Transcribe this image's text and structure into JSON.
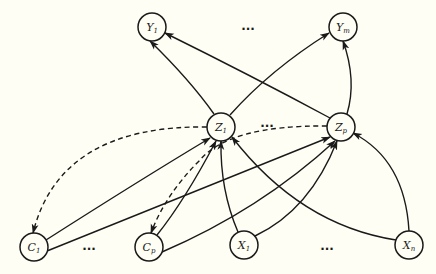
{
  "diagram": {
    "type": "directed-graph",
    "background": "#fffef4",
    "stroke_color": "#1a1a1a",
    "nodes": {
      "Y1": {
        "label": "Y",
        "sub": "1",
        "x": 152,
        "y": 27
      },
      "Ym": {
        "label": "Y",
        "sub": "m",
        "x": 343,
        "y": 27
      },
      "Z1": {
        "label": "Z",
        "sub": "1",
        "x": 221,
        "y": 127
      },
      "Zp": {
        "label": "Z",
        "sub": "p",
        "x": 341,
        "y": 127
      },
      "C1": {
        "label": "C",
        "sub": "1",
        "x": 34,
        "y": 247
      },
      "Cp": {
        "label": "C",
        "sub": "p",
        "x": 149,
        "y": 247
      },
      "X1": {
        "label": "X",
        "sub": "1",
        "x": 244,
        "y": 245
      },
      "Xn": {
        "label": "X",
        "sub": "n",
        "x": 409,
        "y": 245
      }
    },
    "ellipses": {
      "top": "...",
      "middle": "...",
      "bottom_left": "...",
      "bottom_right": "..."
    },
    "edges": [
      {
        "from": "Z1",
        "to": "Y1",
        "style": "solid"
      },
      {
        "from": "Z1",
        "to": "Ym",
        "style": "solid"
      },
      {
        "from": "Zp",
        "to": "Y1",
        "style": "solid"
      },
      {
        "from": "Zp",
        "to": "Ym",
        "style": "solid"
      },
      {
        "from": "C1",
        "to": "Z1",
        "style": "solid"
      },
      {
        "from": "C1",
        "to": "Zp",
        "style": "solid"
      },
      {
        "from": "Cp",
        "to": "Z1",
        "style": "solid"
      },
      {
        "from": "Cp",
        "to": "Zp",
        "style": "solid"
      },
      {
        "from": "X1",
        "to": "Z1",
        "style": "solid"
      },
      {
        "from": "X1",
        "to": "Zp",
        "style": "solid"
      },
      {
        "from": "Xn",
        "to": "Z1",
        "style": "solid"
      },
      {
        "from": "Xn",
        "to": "Zp",
        "style": "solid"
      },
      {
        "from": "Z1",
        "to": "C1",
        "style": "dashed"
      },
      {
        "from": "Zp",
        "to": "Cp",
        "style": "dashed"
      }
    ]
  }
}
